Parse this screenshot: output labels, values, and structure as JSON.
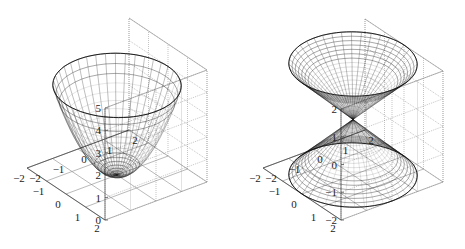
{
  "figure": {
    "background": "#ffffff",
    "axis_color": "#555555",
    "grid_color": "#8a8a8a",
    "mesh_color": "#1a1a1a"
  },
  "chart_data": [
    {
      "type": "surface",
      "title": "",
      "surface": "paraboloid z = x^2 + y^2 (circular domain r <= 2)",
      "xlabel": "",
      "ylabel": "",
      "zlabel": "",
      "xlim": [
        -2,
        2
      ],
      "ylim": [
        -2,
        2
      ],
      "zlim": [
        0,
        5
      ],
      "x_ticks": [
        -2,
        -1,
        0,
        1,
        2
      ],
      "y_ticks": [
        2,
        1,
        0,
        -1,
        -2
      ],
      "z_ticks": [
        0,
        1,
        2,
        3,
        4,
        5
      ],
      "x_tick_labels": [
        "−2",
        "−1",
        "0",
        "1",
        "2"
      ],
      "y_tick_labels": [
        "2",
        "1",
        "0",
        "−1",
        "−2"
      ],
      "z_tick_labels": [
        "0",
        "1",
        "2",
        "3",
        "4",
        "5"
      ],
      "grid": true,
      "mesh": {
        "radial_lines": 40,
        "rings": 20,
        "r_max": 2
      }
    },
    {
      "type": "surface",
      "title": "",
      "surface": "double cone z = ±sqrt(x^2 + y^2) (r <= 2)",
      "xlabel": "",
      "ylabel": "",
      "zlabel": "",
      "xlim": [
        -2,
        2
      ],
      "ylim": [
        -2,
        2
      ],
      "zlim": [
        -2,
        2
      ],
      "x_ticks": [
        -2,
        -1,
        0,
        1,
        2
      ],
      "y_ticks": [
        2,
        1,
        0,
        -1,
        -2
      ],
      "z_ticks": [
        -2,
        -1,
        0,
        1,
        2
      ],
      "x_tick_labels": [
        "−2",
        "−1",
        "0",
        "1",
        "2"
      ],
      "y_tick_labels": [
        "2",
        "1",
        "0",
        "−1",
        "−2"
      ],
      "z_tick_labels": [
        "−2",
        "−1",
        "0",
        "1",
        "2"
      ],
      "grid": true,
      "mesh": {
        "radial_lines": 40,
        "rings": 20,
        "r_max": 2
      }
    }
  ],
  "plots": [
    {
      "geometry": {
        "front": [
          105,
          220
        ],
        "right": [
          207,
          182
        ],
        "left": [
          27,
          168
        ],
        "z_pixels_per_unit": 22.4,
        "z_min": 0,
        "z_max": 5
      }
    },
    {
      "geometry": {
        "front": [
          341,
          220
        ],
        "right": [
          443,
          182
        ],
        "left": [
          263,
          168
        ],
        "z_pixels_per_unit": 27.75,
        "z_min": -2,
        "z_max": 2
      }
    }
  ]
}
